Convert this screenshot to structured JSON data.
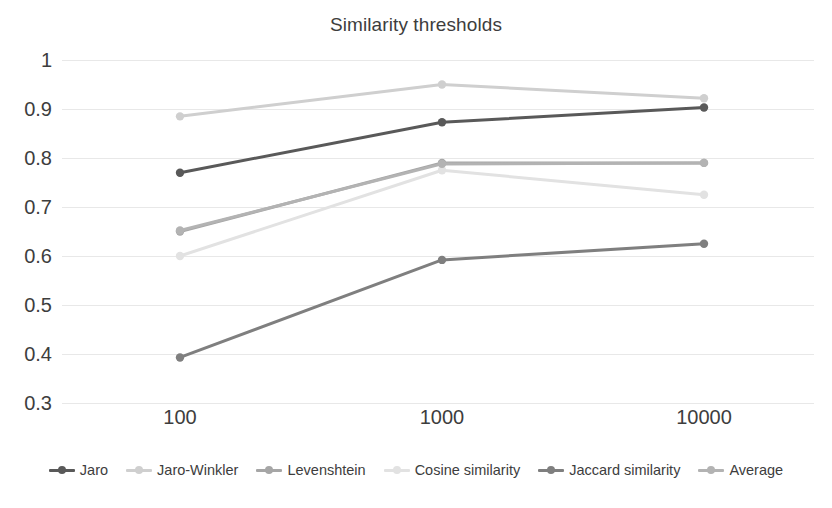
{
  "chart_data": {
    "type": "line",
    "title": "Similarity thresholds",
    "xlabel": "",
    "ylabel": "",
    "categories": [
      "100",
      "1000",
      "10000"
    ],
    "ylim": [
      0.3,
      1
    ],
    "yticks": [
      1,
      0.9,
      0.8,
      0.7,
      0.6,
      0.5,
      0.4,
      0.3
    ],
    "ytick_labels": [
      "1",
      "0.9",
      "0.8",
      "0.7",
      "0.6",
      "0.5",
      "0.4",
      "0.3"
    ],
    "grid": true,
    "legend_position": "bottom",
    "markers": true,
    "series": [
      {
        "name": "Jaro",
        "values": [
          0.77,
          0.873,
          0.903
        ],
        "color": "#595959"
      },
      {
        "name": "Jaro-Winkler",
        "values": [
          0.885,
          0.95,
          0.922
        ],
        "color": "#cfcfcf"
      },
      {
        "name": "Levenshtein",
        "values": [
          0.65,
          0.79,
          0.79
        ],
        "color": "#a6a6a6"
      },
      {
        "name": "Cosine similarity",
        "values": [
          0.6,
          0.775,
          0.725
        ],
        "color": "#e2e2e2"
      },
      {
        "name": "Jaccard similarity",
        "values": [
          0.393,
          0.592,
          0.625
        ],
        "color": "#7f7f7f"
      },
      {
        "name": "Average",
        "values": [
          0.652,
          0.788,
          0.79
        ],
        "color": "#b3b3b3"
      }
    ]
  },
  "legend": {
    "items": [
      {
        "label": "Jaro"
      },
      {
        "label": "Jaro-Winkler"
      },
      {
        "label": "Levenshtein"
      },
      {
        "label": "Cosine similarity"
      },
      {
        "label": "Jaccard similarity"
      },
      {
        "label": "Average"
      }
    ]
  }
}
